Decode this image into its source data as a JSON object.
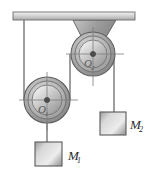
{
  "figure": {
    "background_color": "#ffffff",
    "line_color": "#4a4a4a",
    "fill_light": "#e6e6e6",
    "fill_mid": "#b8b8b8",
    "fill_dark": "#8f8f8f"
  },
  "ceiling": {
    "label": "ceiling-support-bar",
    "x": 13,
    "y": 12,
    "width": 122,
    "height": 8,
    "color": "#c9c9c9"
  },
  "bracket": {
    "label": "V-shaped pulley bracket",
    "apex_x": 93,
    "apex_y": 54,
    "left_x": 73,
    "right_x": 116,
    "top_y": 20,
    "color": "#a8a8a8"
  },
  "pulleys": [
    {
      "name": "upper-pulley",
      "label": "O",
      "subscript": "2",
      "center_x": 93,
      "center_y": 54,
      "r_outer": 22,
      "r_rim": 18,
      "r_inner": 14,
      "r_hub": 2.5,
      "label_x": 84,
      "label_y": 66
    },
    {
      "name": "lower-pulley",
      "label": "O",
      "subscript": "1",
      "center_x": 47,
      "center_y": 100,
      "r_outer": 23,
      "r_rim": 19,
      "r_inner": 15,
      "r_hub": 2.5,
      "label_x": 38,
      "label_y": 112
    }
  ],
  "ropes": [
    {
      "name": "rope-ceiling-to-lower-pulley-left",
      "x1": 24,
      "y1": 20,
      "x2": 24,
      "y2": 100
    },
    {
      "name": "rope-lower-pulley-right-to-upper-pulley-left",
      "x1": 70,
      "y1": 100,
      "x2": 70,
      "y2": 54
    },
    {
      "name": "rope-upper-pulley-right-to-mass-2",
      "x1": 114,
      "y1": 54,
      "x2": 114,
      "y2": 112
    },
    {
      "name": "rope-lower-pulley-hub-to-mass-1",
      "x1": 47,
      "y1": 100,
      "x2": 47,
      "y2": 142
    }
  ],
  "masses": [
    {
      "name": "mass-block-1",
      "label": "M",
      "subscript": "1",
      "x": 35,
      "y": 142,
      "width": 27,
      "height": 24,
      "label_x": 68,
      "label_y": 158
    },
    {
      "name": "mass-block-2",
      "label": "M",
      "subscript": "2",
      "x": 100,
      "y": 112,
      "width": 26,
      "height": 23,
      "label_x": 131,
      "label_y": 127
    }
  ],
  "axis_marks": [
    {
      "name": "upper-pulley-horizontal-axis",
      "x1": 66,
      "y1": 54,
      "x2": 124,
      "y2": 54
    },
    {
      "name": "upper-pulley-vertical-axis",
      "x1": 93,
      "y1": 27,
      "x2": 93,
      "y2": 86
    },
    {
      "name": "lower-pulley-horizontal-axis",
      "x1": 19,
      "y1": 100,
      "x2": 78,
      "y2": 100
    },
    {
      "name": "lower-pulley-vertical-axis",
      "x1": 47,
      "y1": 72,
      "x2": 47,
      "y2": 130
    }
  ]
}
